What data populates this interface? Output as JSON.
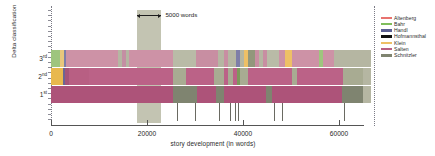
{
  "chart_data": {
    "type": "bar",
    "title": "",
    "xlabel": "story development (in words)",
    "ylabel": "Delta classification",
    "xlim": [
      0,
      66000
    ],
    "ylim": [
      0,
      3
    ],
    "grid": false,
    "legend_position": "right",
    "xticks": [
      {
        "value": 0,
        "label": "0"
      },
      {
        "value": 20000,
        "label": "20000"
      },
      {
        "value": 40000,
        "label": "40000"
      },
      {
        "value": 60000,
        "label": "60000"
      }
    ],
    "yticks": [
      {
        "value": 3,
        "label": "3",
        "suffix": "rd"
      },
      {
        "value": 2,
        "label": "2",
        "suffix": "nd"
      },
      {
        "value": 1,
        "label": "1",
        "suffix": "st"
      }
    ],
    "annotation": {
      "label": "5000 words",
      "from": 18000,
      "to": 23000
    },
    "legend": [
      {
        "name": "Altenberg",
        "color": "#e8736f"
      },
      {
        "name": "Bahr",
        "color": "#7fbd5c"
      },
      {
        "name": "Handl",
        "color": "#5b5f93"
      },
      {
        "name": "Hofmannsthal",
        "color": "#111111"
      },
      {
        "name": "Klein",
        "color": "#eec066"
      },
      {
        "name": "Salten",
        "color": "#b85f83"
      },
      {
        "name": "Schnitzler",
        "color": "#7f8470"
      }
    ],
    "chapter_marks": [
      26200,
      29900,
      34900,
      37200,
      38400,
      39000,
      46400,
      48100,
      61000
    ],
    "series": [
      {
        "name": "3rd",
        "segments": [
          {
            "start": 0,
            "end": 1900,
            "author": "Bahr",
            "color": "#9ec57e"
          },
          {
            "start": 1900,
            "end": 2800,
            "author": "Klein",
            "color": "#e8c77c"
          },
          {
            "start": 2800,
            "end": 3100,
            "author": "Handl",
            "color": "#7e7ea8"
          },
          {
            "start": 3100,
            "end": 13900,
            "author": "Salten",
            "color": "#cd92a6"
          },
          {
            "start": 13900,
            "end": 14700,
            "author": "Schnitzler",
            "color": "#b5b6a2"
          },
          {
            "start": 14700,
            "end": 15700,
            "author": "Salten",
            "color": "#c48fa3"
          },
          {
            "start": 15700,
            "end": 16200,
            "author": "Schnitzler",
            "color": "#b5b6a2"
          },
          {
            "start": 16200,
            "end": 25500,
            "author": "Salten",
            "color": "#cd92a6"
          },
          {
            "start": 25500,
            "end": 30300,
            "author": "Schnitzler",
            "color": "#b9bba7"
          },
          {
            "start": 30300,
            "end": 34800,
            "author": "Salten",
            "color": "#c88ea2"
          },
          {
            "start": 34800,
            "end": 36000,
            "author": "Schnitzler",
            "color": "#b5b6a2"
          },
          {
            "start": 36000,
            "end": 36900,
            "author": "Salten",
            "color": "#c88ea2"
          },
          {
            "start": 36900,
            "end": 38500,
            "author": "Schnitzler",
            "color": "#b5b6a2"
          },
          {
            "start": 38500,
            "end": 39400,
            "author": "Handl",
            "color": "#7e7ea8"
          },
          {
            "start": 39400,
            "end": 40200,
            "author": "Schnitzler",
            "color": "#b5b6a2"
          },
          {
            "start": 40200,
            "end": 41100,
            "author": "Klein",
            "color": "#eec066"
          },
          {
            "start": 41100,
            "end": 42400,
            "author": "Schnitzler",
            "color": "#92977c"
          },
          {
            "start": 42400,
            "end": 43300,
            "author": "Salten",
            "color": "#c88ea2"
          },
          {
            "start": 43300,
            "end": 44100,
            "author": "Schnitzler",
            "color": "#b5b6a2"
          },
          {
            "start": 44100,
            "end": 45000,
            "author": "Salten",
            "color": "#c88ea2"
          },
          {
            "start": 45000,
            "end": 47600,
            "author": "Schnitzler",
            "color": "#b9bba7"
          },
          {
            "start": 47600,
            "end": 48800,
            "author": "Salten",
            "color": "#cd92a6"
          },
          {
            "start": 48800,
            "end": 50300,
            "author": "Klein",
            "color": "#eec066"
          },
          {
            "start": 50300,
            "end": 55800,
            "author": "Salten",
            "color": "#cd92a6"
          },
          {
            "start": 55800,
            "end": 56700,
            "author": "Bahr",
            "color": "#9ec57e"
          },
          {
            "start": 56700,
            "end": 58900,
            "author": "Salten",
            "color": "#cd92a6"
          },
          {
            "start": 58900,
            "end": 65000,
            "author": "Schnitzler",
            "color": "#b5b6a2"
          }
        ]
      },
      {
        "name": "2nd",
        "segments": [
          {
            "start": 0,
            "end": 2500,
            "author": "Klein",
            "color": "#e8b84e"
          },
          {
            "start": 2500,
            "end": 3000,
            "author": "Handl",
            "color": "#6a6694"
          },
          {
            "start": 3000,
            "end": 3700,
            "author": "Salten",
            "color": "#a4547a"
          },
          {
            "start": 3700,
            "end": 8000,
            "author": "Salten",
            "color": "#b85f83"
          },
          {
            "start": 8000,
            "end": 25400,
            "author": "Salten",
            "color": "#bb6287"
          },
          {
            "start": 25400,
            "end": 28200,
            "author": "Schnitzler",
            "color": "#a8ab92"
          },
          {
            "start": 28200,
            "end": 33900,
            "author": "Salten",
            "color": "#bb6287"
          },
          {
            "start": 33900,
            "end": 36000,
            "author": "Schnitzler",
            "color": "#a8ab92"
          },
          {
            "start": 36000,
            "end": 36900,
            "author": "Salten",
            "color": "#bb6287"
          },
          {
            "start": 36900,
            "end": 37900,
            "author": "Schnitzler",
            "color": "#a8ab92"
          },
          {
            "start": 37900,
            "end": 38700,
            "author": "Salten",
            "color": "#bb6287"
          },
          {
            "start": 38700,
            "end": 39400,
            "author": "Bahr",
            "color": "#7c9a5c"
          },
          {
            "start": 39400,
            "end": 41000,
            "author": "Schnitzler",
            "color": "#a8ab92"
          },
          {
            "start": 41000,
            "end": 50200,
            "author": "Salten",
            "color": "#bb6287"
          },
          {
            "start": 50200,
            "end": 51200,
            "author": "Schnitzler",
            "color": "#a8ab92"
          },
          {
            "start": 51200,
            "end": 60800,
            "author": "Salten",
            "color": "#bb6287"
          },
          {
            "start": 60800,
            "end": 65000,
            "author": "Schnitzler",
            "color": "#a8ab92"
          }
        ]
      },
      {
        "name": "1st",
        "segments": [
          {
            "start": 0,
            "end": 25500,
            "author": "Salten",
            "color": "#ad5379"
          },
          {
            "start": 25500,
            "end": 30500,
            "author": "Schnitzler",
            "color": "#7f8470"
          },
          {
            "start": 30500,
            "end": 34300,
            "author": "Salten",
            "color": "#ad5379"
          },
          {
            "start": 34300,
            "end": 36100,
            "author": "Schnitzler",
            "color": "#7f8470"
          },
          {
            "start": 36100,
            "end": 44800,
            "author": "Salten",
            "color": "#ad5379"
          },
          {
            "start": 44800,
            "end": 46000,
            "author": "Schnitzler",
            "color": "#7f8470"
          },
          {
            "start": 46000,
            "end": 60700,
            "author": "Salten",
            "color": "#ad5379"
          },
          {
            "start": 60700,
            "end": 65000,
            "author": "Schnitzler",
            "color": "#7f8470"
          }
        ]
      }
    ]
  }
}
